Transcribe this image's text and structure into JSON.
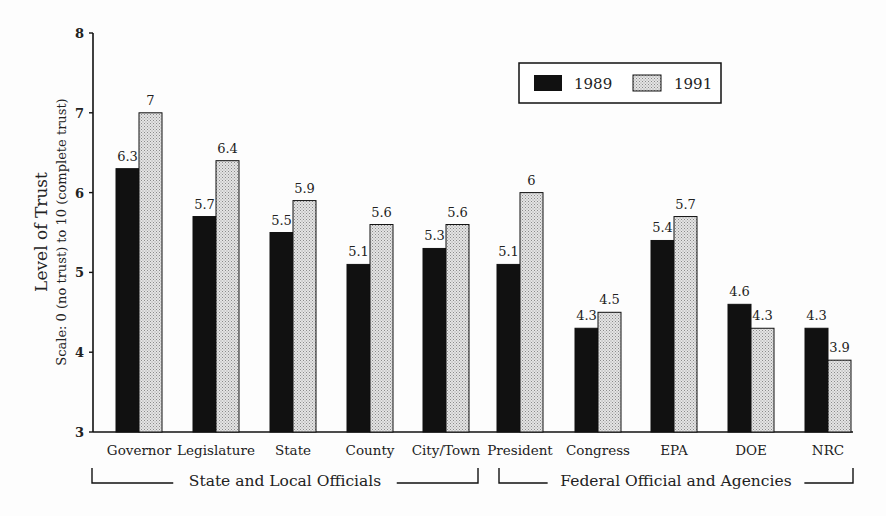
{
  "chart_data": {
    "type": "bar",
    "title": "",
    "ylabel": "Level of Trust",
    "ylabel_sub": "Scale:  0 (no trust) to 10 (complete trust)",
    "xlabel": "",
    "ylim": [
      3,
      8
    ],
    "yticks": [
      3,
      4,
      5,
      6,
      7,
      8
    ],
    "grid": false,
    "legend_position": "top-right",
    "categories": [
      "Governor",
      "Legislature",
      "State",
      "County",
      "City/Town",
      "President",
      "Congress",
      "EPA",
      "DOE",
      "NRC"
    ],
    "series": [
      {
        "name": "1989",
        "color": "#111111",
        "values": [
          6.3,
          5.7,
          5.5,
          5.1,
          5.3,
          5.1,
          4.3,
          5.4,
          4.6,
          4.3
        ],
        "labels": [
          "6.3",
          "5.7",
          "5.5",
          "5.1",
          "5.3",
          "5.1",
          "4.3",
          "5.4",
          "4.6",
          "4.3"
        ]
      },
      {
        "name": "1991",
        "color": "#cfcfcf",
        "values": [
          7,
          6.4,
          5.9,
          5.6,
          5.6,
          6,
          4.5,
          5.7,
          4.3,
          3.9
        ],
        "labels": [
          "7",
          "6.4",
          "5.9",
          "5.6",
          "5.6",
          "6",
          "4.5",
          "5.7",
          "4.3",
          "3.9"
        ]
      }
    ],
    "groups": [
      {
        "label": "State and Local Officials",
        "categories": [
          "Governor",
          "Legislature",
          "State",
          "County",
          "City/Town"
        ]
      },
      {
        "label": "Federal Official and Agencies",
        "categories": [
          "President",
          "Congress",
          "EPA",
          "DOE",
          "NRC"
        ]
      }
    ]
  }
}
